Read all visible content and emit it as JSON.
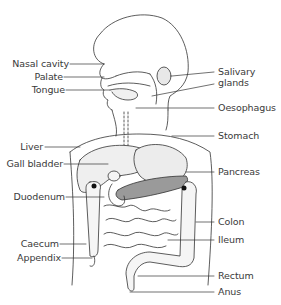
{
  "diagram": {
    "type": "anatomy",
    "labels_left": [
      {
        "id": "nasal-cavity",
        "text": "Nasal cavity"
      },
      {
        "id": "palate",
        "text": "Palate"
      },
      {
        "id": "tongue",
        "text": "Tongue"
      },
      {
        "id": "liver",
        "text": "Liver"
      },
      {
        "id": "gall-bladder",
        "text": "Gall bladder"
      },
      {
        "id": "duodenum",
        "text": "Duodenum"
      },
      {
        "id": "caecum",
        "text": "Caecum"
      },
      {
        "id": "appendix",
        "text": "Appendix"
      }
    ],
    "labels_right": [
      {
        "id": "salivary-glands",
        "text": "Salivary\nglands",
        "line1": "Salivary",
        "line2": "glands"
      },
      {
        "id": "oesophagus",
        "text": "Oesophagus"
      },
      {
        "id": "stomach",
        "text": "Stomach"
      },
      {
        "id": "pancreas",
        "text": "Pancreas"
      },
      {
        "id": "colon",
        "text": "Colon"
      },
      {
        "id": "ileum",
        "text": "Ileum"
      },
      {
        "id": "rectum",
        "text": "Rectum"
      },
      {
        "id": "anus",
        "text": "Anus"
      }
    ],
    "colors": {
      "line": "#333333",
      "organ_fill": "#eeeeee",
      "pancreas_fill": "#9a9a9a",
      "text": "#3a3a3a"
    }
  }
}
